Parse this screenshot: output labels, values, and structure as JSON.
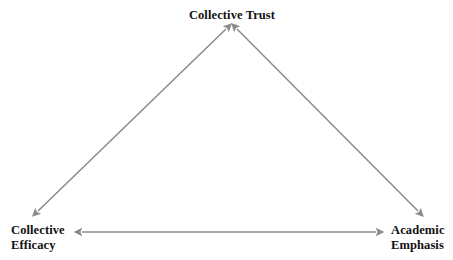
{
  "diagram": {
    "type": "triangular-relationship-model",
    "background_color": "#ffffff",
    "arrow_color": "#8a8a8a",
    "text_color": "#111111",
    "nodes": [
      {
        "id": "collective-trust",
        "label": "Collective Trust",
        "position": "top"
      },
      {
        "id": "collective-efficacy",
        "label": "Collective\nEfficacy",
        "position": "bottom-left"
      },
      {
        "id": "academic-emphasis",
        "label": "Academic\nEmphasis",
        "position": "bottom-right"
      }
    ],
    "connectors": [
      {
        "id": "efficacy-trust",
        "from": "collective-efficacy",
        "to": "collective-trust",
        "style": "double-headed-arrow"
      },
      {
        "id": "trust-academic",
        "from": "collective-trust",
        "to": "academic-emphasis",
        "style": "double-headed-arrow"
      },
      {
        "id": "efficacy-academic",
        "from": "collective-efficacy",
        "to": "academic-emphasis",
        "style": "double-headed-arrow"
      }
    ]
  }
}
